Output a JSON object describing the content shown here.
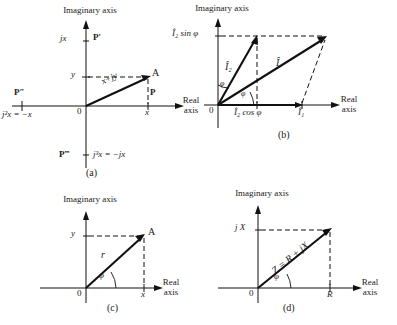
{
  "figure": {
    "axis_labels": {
      "imaginary": "Imaginary axis",
      "real_line1": "Real",
      "real_line2": "axis"
    },
    "origin": "0"
  },
  "panel_a": {
    "caption": "(a)",
    "point_A": "A",
    "point_P": "P",
    "point_P_prime": "P′",
    "point_P_double": "P″",
    "point_P_triple": "P‴",
    "tick_jx": "jx",
    "tick_x": "x",
    "tick_y": "y",
    "vector_label": "x+jy",
    "label_j2": "j²x = −x",
    "label_j3": "j³x = −jx"
  },
  "panel_b": {
    "caption": "(b)",
    "vector_I": "Î",
    "vector_I1": "Î₁",
    "vector_I2": "Î₂",
    "label_I2_sin": "Î₂ sin φ",
    "label_I2_cos": "Î₂ cos φ",
    "angle_upper": "φ",
    "angle_lower": "φ"
  },
  "panel_c": {
    "caption": "(c)",
    "point_A": "A",
    "tick_x": "x",
    "tick_y": "y",
    "vector_label": "r",
    "angle": "φ"
  },
  "panel_d": {
    "caption": "(d)",
    "tick_jX": "j X",
    "tick_R": "R",
    "vector_label": "Z = R + jX",
    "angle": "φ"
  },
  "colors": {
    "ink": "#111111",
    "background": "#ffffff"
  }
}
